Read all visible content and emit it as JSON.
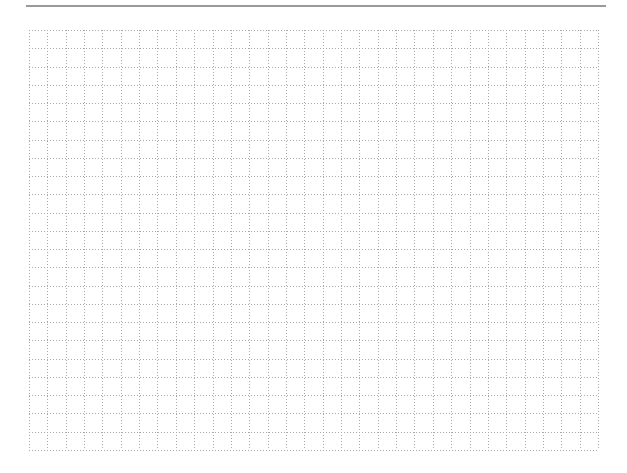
{
  "document": {
    "type": "graph-paper",
    "top_rule": {
      "color": "#9a9a9a"
    },
    "grid": {
      "columns": 31,
      "rows": 23,
      "line_style": "dotted",
      "line_color": "#a8a8a8"
    }
  }
}
